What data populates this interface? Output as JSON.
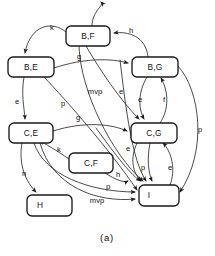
{
  "figure": {
    "caption": "(a)",
    "kind": "state-transition-diagram"
  },
  "nodes": [
    {
      "id": "BF",
      "label": "B,F",
      "x": 66,
      "y": 26,
      "w": 44,
      "h": 20
    },
    {
      "id": "BE",
      "label": "B,E",
      "x": 8,
      "y": 57,
      "w": 46,
      "h": 20
    },
    {
      "id": "BG",
      "label": "B,G",
      "x": 132,
      "y": 57,
      "w": 46,
      "h": 20
    },
    {
      "id": "CE",
      "label": "C,E",
      "x": 9,
      "y": 123,
      "w": 44,
      "h": 20
    },
    {
      "id": "CG",
      "label": "C,G",
      "x": 131,
      "y": 123,
      "w": 46,
      "h": 20
    },
    {
      "id": "CF",
      "label": "C,F",
      "x": 69,
      "y": 153,
      "w": 44,
      "h": 20
    },
    {
      "id": "I",
      "label": "I",
      "x": 139,
      "y": 185,
      "w": 40,
      "h": 21
    },
    {
      "id": "H",
      "label": "H",
      "x": 27,
      "y": 195,
      "w": 45,
      "h": 21
    }
  ],
  "edges": [
    {
      "id": "bf-be",
      "label": "k",
      "from": "BF",
      "to": "BE",
      "label_x": 52,
      "label_y": 28
    },
    {
      "id": "bg-bf",
      "label": "h",
      "from": "BG",
      "to": "BF",
      "label_x": 131,
      "label_y": 31
    },
    {
      "id": "be-bg",
      "label": "g",
      "from": "BE",
      "to": "BG",
      "label_x": 79,
      "label_y": 57
    },
    {
      "id": "be-ce",
      "label": "e",
      "from": "BE",
      "to": "CE",
      "label_x": 17,
      "label_y": 102
    },
    {
      "id": "be-i",
      "label": "p",
      "from": "BE",
      "to": "I",
      "label_x": 63,
      "label_y": 104
    },
    {
      "id": "bf-cg",
      "label": "e",
      "from": "BF",
      "to": "CG",
      "label_x": 121,
      "label_y": 92
    },
    {
      "id": "bf-i",
      "label": "mvp",
      "from": "BF",
      "to": "I",
      "label_x": 95,
      "label_y": 92
    },
    {
      "id": "bg-cg",
      "label": "e",
      "from": "BG",
      "to": "CG",
      "label_x": 141,
      "label_y": 100
    },
    {
      "id": "cg-bg",
      "label": "f",
      "from": "CG",
      "to": "BG",
      "label_x": 163,
      "label_y": 100
    },
    {
      "id": "bg-i",
      "label": "p",
      "from": "BG",
      "to": "I",
      "label_x": 200,
      "label_y": 130
    },
    {
      "id": "ce-cg",
      "label": "g",
      "from": "CE",
      "to": "CG",
      "label_x": 78,
      "label_y": 118
    },
    {
      "id": "cf-ce",
      "label": "k",
      "from": "CF",
      "to": "CE",
      "label_x": 59,
      "label_y": 150
    },
    {
      "id": "cf-i",
      "label": "h",
      "from": "CF",
      "to": "I",
      "label_x": 118,
      "label_y": 175
    },
    {
      "id": "ce-h",
      "label": "n",
      "from": "CE",
      "to": "H",
      "label_x": 24,
      "label_y": 174
    },
    {
      "id": "ce-i",
      "label": "p",
      "from": "CE",
      "to": "I",
      "label_x": 108,
      "label_y": 187
    },
    {
      "id": "ce-i2",
      "label": "mvp",
      "from": "CE",
      "to": "I",
      "label_x": 97,
      "label_y": 200
    },
    {
      "id": "cg-i-e",
      "label": "e",
      "from": "CG",
      "to": "I",
      "label_x": 128,
      "label_y": 147
    },
    {
      "id": "cg-i-p",
      "label": "p",
      "from": "CG",
      "to": "I",
      "label_x": 143,
      "label_y": 168
    },
    {
      "id": "i-cg",
      "label": "e",
      "from": "I",
      "to": "CG",
      "label_x": 168,
      "label_y": 168
    }
  ]
}
